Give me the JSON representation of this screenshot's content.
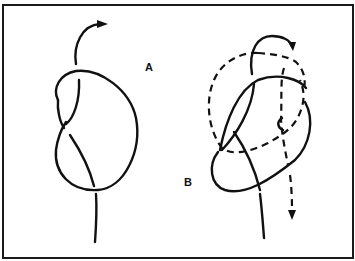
{
  "figure": {
    "colors": {
      "line": "#111111",
      "background": "#ffffff",
      "frame": "#1a1a1a"
    },
    "panels": [
      {
        "id": "A",
        "label": "A",
        "content": "Overhand loop with working end passing up and over with arrow"
      },
      {
        "id": "B",
        "label": "B",
        "content": "Working end retracing path (dashed) with downward arrow"
      }
    ]
  }
}
